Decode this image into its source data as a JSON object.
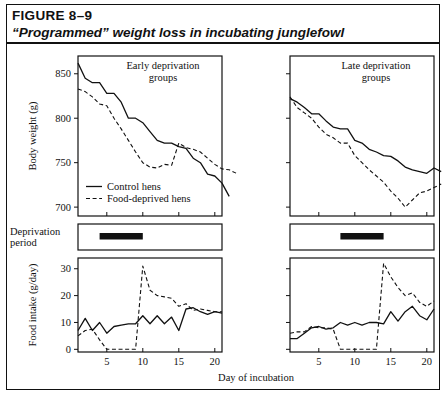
{
  "figure": {
    "label": "FIGURE 8–9",
    "title": "“Programmed” weight loss in incubating junglefowl"
  },
  "deprivation": {
    "label_line1": "Deprivation",
    "label_line2": "period",
    "early_bar_days": [
      4,
      10
    ],
    "late_bar_days": [
      8,
      14
    ]
  },
  "legend": {
    "control": "Control hens",
    "deprived": "Food-deprived hens"
  },
  "panels": {
    "early": "Early deprivation\ngroups",
    "early_line1": "Early deprivation",
    "early_line2": "groups",
    "late_line1": "Late deprivation",
    "late_line2": "groups"
  },
  "chart_data": [
    {
      "type": "line",
      "id": "weight-early",
      "title": "Early deprivation groups",
      "xlabel": "Day of incubation",
      "ylabel": "Body weight (g)",
      "xlim": [
        1,
        21
      ],
      "ylim": [
        690,
        870
      ],
      "yticks": [
        700,
        750,
        800,
        850
      ],
      "xticks": [
        5,
        10,
        15,
        20
      ],
      "grid": false,
      "legend_position": "inside-bottom-left",
      "x": [
        1,
        2,
        3,
        4,
        5,
        6,
        7,
        8,
        9,
        10,
        11,
        12,
        13,
        14,
        15,
        16,
        17,
        18,
        19,
        20,
        21
      ],
      "series": [
        {
          "name": "Control hens",
          "style": "solid",
          "values": [
            862,
            845,
            840,
            840,
            828,
            828,
            818,
            800,
            800,
            795,
            785,
            775,
            772,
            772,
            768,
            766,
            755,
            750,
            737,
            735,
            727,
            712
          ]
        },
        {
          "name": "Food-deprived hens",
          "style": "dashed",
          "values": [
            833,
            830,
            824,
            816,
            814,
            800,
            788,
            775,
            762,
            750,
            745,
            744,
            748,
            747,
            772,
            767,
            765,
            762,
            755,
            748,
            743,
            742,
            738
          ]
        }
      ]
    },
    {
      "type": "line",
      "id": "weight-late",
      "title": "Late deprivation groups",
      "xlabel": "Day of incubation",
      "ylabel": "Body weight (g)",
      "xlim": [
        1,
        21
      ],
      "ylim": [
        690,
        870
      ],
      "yticks": [
        700,
        750,
        800,
        850
      ],
      "xticks": [
        5,
        10,
        15,
        20
      ],
      "grid": false,
      "x": [
        1,
        2,
        3,
        4,
        5,
        6,
        7,
        8,
        9,
        10,
        11,
        12,
        13,
        14,
        15,
        16,
        17,
        18,
        19,
        20,
        21
      ],
      "series": [
        {
          "name": "Control hens",
          "style": "solid",
          "values": [
            822,
            818,
            812,
            805,
            805,
            797,
            790,
            788,
            788,
            775,
            772,
            765,
            762,
            758,
            757,
            752,
            745,
            742,
            740,
            738,
            744,
            740
          ]
        },
        {
          "name": "Food-deprived hens",
          "style": "dashed",
          "values": [
            824,
            812,
            806,
            800,
            790,
            782,
            778,
            772,
            772,
            758,
            750,
            742,
            735,
            728,
            718,
            710,
            700,
            708,
            716,
            718,
            722,
            726
          ]
        }
      ]
    },
    {
      "type": "line",
      "id": "intake-early",
      "title": "Early deprivation groups",
      "xlabel": "Day of incubation",
      "ylabel": "Food intake (g/day)",
      "xlim": [
        1,
        21
      ],
      "ylim": [
        -1,
        34
      ],
      "yticks": [
        0,
        10,
        20,
        30
      ],
      "xticks": [
        5,
        10,
        15,
        20
      ],
      "grid": false,
      "x": [
        1,
        2,
        3,
        4,
        5,
        6,
        7,
        8,
        9,
        10,
        11,
        12,
        13,
        14,
        15,
        16,
        17,
        18,
        19,
        20,
        21
      ],
      "series": [
        {
          "name": "Control hens",
          "style": "solid",
          "values": [
            7,
            11.5,
            7,
            10,
            6,
            8.5,
            9,
            9.5,
            9.5,
            12.5,
            9.5,
            12.5,
            9.5,
            12,
            7,
            15,
            15.5,
            14,
            13,
            14,
            13.5
          ]
        },
        {
          "name": "Food-deprived hens",
          "style": "dashed",
          "values": [
            5,
            7,
            7.5,
            3.5,
            0,
            0,
            0,
            0,
            0,
            31,
            22,
            20,
            19.5,
            19,
            16,
            17,
            14.5,
            15,
            14.5,
            14,
            14
          ]
        }
      ]
    },
    {
      "type": "line",
      "id": "intake-late",
      "title": "Late deprivation groups",
      "xlabel": "Day of incubation",
      "ylabel": "Food intake (g/day)",
      "xlim": [
        1,
        21
      ],
      "ylim": [
        -1,
        34
      ],
      "yticks": [
        0,
        10,
        20,
        30
      ],
      "xticks": [
        5,
        10,
        15,
        20
      ],
      "grid": false,
      "x": [
        1,
        2,
        3,
        4,
        5,
        6,
        7,
        8,
        9,
        10,
        11,
        12,
        13,
        14,
        15,
        16,
        17,
        18,
        19,
        20,
        21
      ],
      "series": [
        {
          "name": "Control hens",
          "style": "solid",
          "values": [
            4,
            4,
            6,
            8,
            8.5,
            7.5,
            8,
            10,
            9,
            10,
            9,
            10,
            10,
            9.5,
            14,
            10.5,
            14,
            16,
            12.5,
            11,
            15
          ]
        },
        {
          "name": "Food-deprived hens",
          "style": "dashed",
          "values": [
            6,
            6.5,
            6.5,
            8.5,
            8,
            8,
            7.5,
            0,
            0,
            0,
            0,
            0,
            0,
            32,
            27,
            23,
            20,
            21,
            17.5,
            16,
            18
          ]
        }
      ]
    }
  ],
  "axis": {
    "body_weight": "Body weight (g)",
    "food_intake": "Food intake (g/day)",
    "day": "Day of incubation"
  }
}
